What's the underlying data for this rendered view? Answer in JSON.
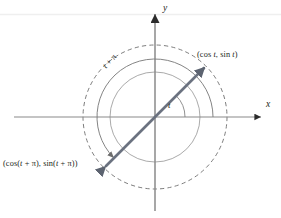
{
  "figure": {
    "name": "unit-circle-antipodal-points-diagram",
    "type": "math-diagram",
    "canvas": {
      "width": 281,
      "height": 218,
      "background": "#ffffff"
    },
    "origin": {
      "x": 155,
      "y": 117
    },
    "axes": {
      "x": {
        "label": "x",
        "style": "solid-arrow-right",
        "color": "#7f7f7f",
        "from": {
          "x": 14,
          "y": 117
        },
        "to": {
          "x": 264,
          "y": 117
        }
      },
      "y": {
        "label": "y",
        "style": "solid-arrow-up",
        "color": "#7f7f7f",
        "from": {
          "x": 155,
          "y": 210
        },
        "to": {
          "x": 155,
          "y": 11
        }
      }
    },
    "circles": [
      {
        "name": "inner-angle-arc-circle",
        "radius": 45,
        "stroke": "#8c8c8c",
        "dash": "none",
        "width": 0.8
      },
      {
        "name": "outer-unit-circle",
        "radius": 72,
        "stroke": "#6e6e6e",
        "dash": "4 3",
        "width": 0.9
      }
    ],
    "vector": {
      "name": "diameter-double-arrow",
      "color": "#6b7280",
      "width": 2.6,
      "angle_degrees": 45,
      "arrowheads": "both",
      "tip_point": {
        "x": 206,
        "y": 66
      },
      "tail_point": {
        "x": 104,
        "y": 168
      }
    },
    "arcs": [
      {
        "name": "angle-t-arc",
        "label": "t",
        "radius": 30,
        "from_degrees": 0,
        "to_degrees": 45,
        "color": "#6e6e6e"
      },
      {
        "name": "angle-t-plus-pi-arc",
        "label": "t + π",
        "radius": 58,
        "from_degrees": 0,
        "to_degrees": 225,
        "color": "#6e6e6e",
        "arrowhead": "end"
      }
    ],
    "labels": {
      "axis_x": "x",
      "axis_y": "y",
      "angle_t": "t",
      "angle_t_plus_pi": "t + π",
      "point_t": "(cos t, sin t)",
      "point_t_pi": "(cos(t + π), sin(t + π))"
    },
    "artifacts": {
      "top_scan_line": {
        "name": "page-scan-line",
        "color": "#eeeeee",
        "y": 14
      }
    }
  }
}
